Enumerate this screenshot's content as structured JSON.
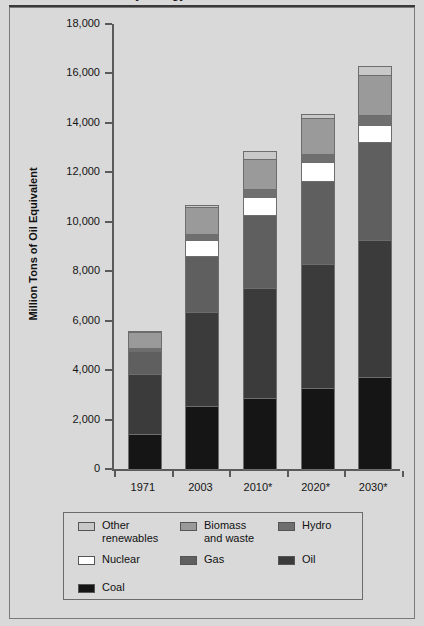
{
  "figure": {
    "clipped_title": "World Primary Energy Demand, 1971-2030",
    "note_asterisk": "*"
  },
  "chart_data": {
    "type": "bar",
    "stacked": true,
    "title": "",
    "xlabel": "",
    "ylabel": "Million Tons of Oil Equivalent",
    "ylim": [
      0,
      18000
    ],
    "ytick_labels": [
      "18,000",
      "16,000",
      "14,000",
      "12,000",
      "10,000",
      "8,000",
      "6,000",
      "4,000",
      "2,000",
      "0"
    ],
    "ytick_values": [
      18000,
      16000,
      14000,
      12000,
      10000,
      8000,
      6000,
      4000,
      2000,
      0
    ],
    "grid": false,
    "legend_position": "below-plot",
    "categories": [
      "1971",
      "2003",
      "2010*",
      "2020*",
      "2030*"
    ],
    "series": [
      {
        "name": "Coal",
        "color": "#151515",
        "values": [
          1450,
          2600,
          2900,
          3300,
          3750
        ]
      },
      {
        "name": "Oil",
        "color": "#3b3b3b",
        "values": [
          2450,
          3800,
          4450,
          5050,
          5550
        ]
      },
      {
        "name": "Gas",
        "color": "#5f5f5f",
        "values": [
          900,
          2250,
          2950,
          3350,
          3950
        ]
      },
      {
        "name": "Nuclear",
        "color": "#ffffff",
        "values": [
          30,
          650,
          750,
          750,
          700
        ]
      },
      {
        "name": "Hydro",
        "color": "#6f6f6f",
        "values": [
          110,
          250,
          300,
          350,
          400
        ]
      },
      {
        "name": "Biomass and waste",
        "color": "#9a9a9a",
        "values": [
          640,
          1100,
          1250,
          1450,
          1650
        ]
      },
      {
        "name": "Other renewables",
        "color": "#c8c8c8",
        "values": [
          10,
          60,
          300,
          150,
          350
        ]
      }
    ],
    "totals": [
      5590,
      10710,
      12900,
      14400,
      16350
    ]
  },
  "legend": {
    "items": [
      {
        "label": "Other\nrenewables",
        "swatch": "#c8c8c8"
      },
      {
        "label": "Biomass\nand waste",
        "swatch": "#9a9a9a"
      },
      {
        "label": "Hydro",
        "swatch": "#6f6f6f"
      },
      {
        "label": "Nuclear",
        "swatch": "#ffffff"
      },
      {
        "label": "Gas",
        "swatch": "#5f5f5f"
      },
      {
        "label": "Oil",
        "swatch": "#3b3b3b"
      },
      {
        "label": "Coal",
        "swatch": "#151515"
      }
    ]
  }
}
